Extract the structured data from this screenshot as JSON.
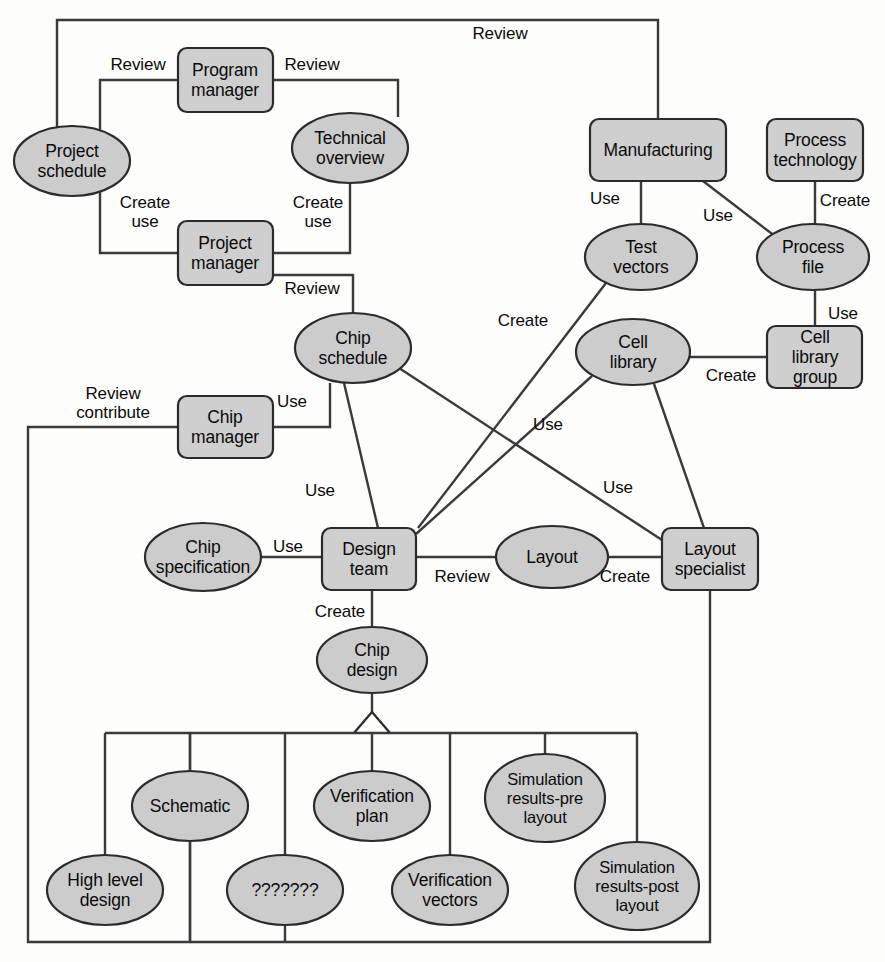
{
  "diagram": {
    "type": "entity-relationship-diagram",
    "background_color": "#fdfdfb",
    "node_fill_color": "#cccccc",
    "node_stroke_color": "#2b2b2b",
    "edge_color": "#3a3a3a",
    "nodes": [
      {
        "id": "project-schedule",
        "label": "Project\nschedule",
        "shape": "ellipse",
        "cx": 72,
        "cy": 161,
        "rx": 58,
        "ry": 35
      },
      {
        "id": "program-manager",
        "label": "Program\nmanager",
        "shape": "box",
        "cx": 225,
        "cy": 80,
        "w": 95,
        "h": 64
      },
      {
        "id": "technical-overview",
        "label": "Technical\noverview",
        "shape": "ellipse",
        "cx": 350,
        "cy": 148,
        "rx": 58,
        "ry": 35
      },
      {
        "id": "project-manager",
        "label": "Project\nmanager",
        "shape": "box",
        "cx": 225,
        "cy": 253,
        "w": 95,
        "h": 64
      },
      {
        "id": "chip-schedule",
        "label": "Chip\nschedule",
        "shape": "ellipse",
        "cx": 353,
        "cy": 348,
        "rx": 58,
        "ry": 35
      },
      {
        "id": "chip-manager",
        "label": "Chip\nmanager",
        "shape": "box",
        "cx": 225,
        "cy": 427,
        "w": 95,
        "h": 62
      },
      {
        "id": "chip-specification",
        "label": "Chip\nspecification",
        "shape": "ellipse",
        "cx": 203,
        "cy": 557,
        "rx": 58,
        "ry": 34
      },
      {
        "id": "design-team",
        "label": "Design\nteam",
        "shape": "box",
        "cx": 369,
        "cy": 559,
        "w": 94,
        "h": 62
      },
      {
        "id": "layout",
        "label": "Layout",
        "shape": "ellipse",
        "cx": 552,
        "cy": 557,
        "rx": 56,
        "ry": 31
      },
      {
        "id": "layout-specialist",
        "label": "Layout\nspecialist",
        "shape": "box",
        "cx": 710,
        "cy": 559,
        "w": 96,
        "h": 62
      },
      {
        "id": "manufacturing",
        "label": "Manufacturing",
        "shape": "box",
        "cx": 658,
        "cy": 150,
        "w": 136,
        "h": 62
      },
      {
        "id": "process-technology",
        "label": "Process\ntechnology",
        "shape": "box",
        "cx": 815,
        "cy": 150,
        "w": 96,
        "h": 62
      },
      {
        "id": "test-vectors",
        "label": "Test\nvectors",
        "shape": "ellipse",
        "cx": 641,
        "cy": 257,
        "rx": 56,
        "ry": 33
      },
      {
        "id": "process-file",
        "label": "Process\nfile",
        "shape": "ellipse",
        "cx": 813,
        "cy": 257,
        "rx": 56,
        "ry": 33
      },
      {
        "id": "cell-library",
        "label": "Cell\nlibrary",
        "shape": "ellipse",
        "cx": 633,
        "cy": 352,
        "rx": 57,
        "ry": 33
      },
      {
        "id": "cell-library-group",
        "label": "Cell library\ngroup",
        "shape": "box",
        "cx": 815,
        "cy": 357,
        "w": 95,
        "h": 62
      },
      {
        "id": "chip-design",
        "label": "Chip\ndesign",
        "shape": "ellipse",
        "cx": 372,
        "cy": 660,
        "rx": 55,
        "ry": 33
      },
      {
        "id": "schematic",
        "label": "Schematic",
        "shape": "ellipse",
        "cx": 190,
        "cy": 806,
        "rx": 58,
        "ry": 35
      },
      {
        "id": "high-level-design",
        "label": "High level\ndesign",
        "shape": "ellipse",
        "cx": 105,
        "cy": 890,
        "rx": 58,
        "ry": 35
      },
      {
        "id": "unknown-artifact",
        "label": "???????",
        "shape": "ellipse",
        "cx": 285,
        "cy": 890,
        "rx": 58,
        "ry": 35
      },
      {
        "id": "verification-plan",
        "label": "Verification\nplan",
        "shape": "ellipse",
        "cx": 372,
        "cy": 806,
        "rx": 58,
        "ry": 35
      },
      {
        "id": "verification-vectors",
        "label": "Verification\nvectors",
        "shape": "ellipse",
        "cx": 450,
        "cy": 890,
        "rx": 58,
        "ry": 35
      },
      {
        "id": "simulation-results-pre",
        "label": "Simulation\nresults-pre\nlayout",
        "shape": "ellipse",
        "cx": 545,
        "cy": 798,
        "rx": 60,
        "ry": 44
      },
      {
        "id": "simulation-results-post",
        "label": "Simulation\nresults-post\nlayout",
        "shape": "ellipse",
        "cx": 637,
        "cy": 886,
        "rx": 62,
        "ry": 44
      }
    ],
    "edge_labels": [
      {
        "id": "review-top",
        "text": "Review",
        "x": 500,
        "y": 33
      },
      {
        "id": "review-ps-pm",
        "text": "Review",
        "x": 138,
        "y": 64
      },
      {
        "id": "review-pm-to",
        "text": "Review",
        "x": 312,
        "y": 64
      },
      {
        "id": "create-use-left",
        "text": "Create\nuse",
        "x": 145,
        "y": 212
      },
      {
        "id": "create-use-right",
        "text": "Create\nuse",
        "x": 318,
        "y": 212
      },
      {
        "id": "review-pm-cs",
        "text": "Review",
        "x": 312,
        "y": 288
      },
      {
        "id": "review-contribute",
        "text": "Review\ncontribute",
        "x": 113,
        "y": 403
      },
      {
        "id": "use-cm-cs",
        "text": "Use",
        "x": 292,
        "y": 401
      },
      {
        "id": "use-cs-dt",
        "text": "Use",
        "x": 320,
        "y": 490
      },
      {
        "id": "use-cspec-dt",
        "text": "Use",
        "x": 288,
        "y": 546
      },
      {
        "id": "review-dt-layout",
        "text": "Review",
        "x": 462,
        "y": 576
      },
      {
        "id": "create-layout-ls",
        "text": "Create",
        "x": 625,
        "y": 576
      },
      {
        "id": "create-dt-cd",
        "text": "Create",
        "x": 340,
        "y": 611
      },
      {
        "id": "use-mfg-tv",
        "text": "Use",
        "x": 605,
        "y": 198
      },
      {
        "id": "use-mfg-pf",
        "text": "Use",
        "x": 718,
        "y": 215
      },
      {
        "id": "create-pt-pf",
        "text": "Create",
        "x": 845,
        "y": 200
      },
      {
        "id": "use-pf-clg",
        "text": "Use",
        "x": 843,
        "y": 313
      },
      {
        "id": "create-clg-cl",
        "text": "Create",
        "x": 731,
        "y": 375
      },
      {
        "id": "create-tv-dt",
        "text": "Create",
        "x": 523,
        "y": 320
      },
      {
        "id": "use-cl-dt",
        "text": "Use",
        "x": 548,
        "y": 424
      },
      {
        "id": "use-cl-ls",
        "text": "Use",
        "x": 618,
        "y": 487
      }
    ],
    "relationships": [
      {
        "from": "project-schedule",
        "to": "manufacturing",
        "label": "Review"
      },
      {
        "from": "project-schedule",
        "to": "program-manager",
        "label": "Review"
      },
      {
        "from": "program-manager",
        "to": "technical-overview",
        "label": "Review"
      },
      {
        "from": "project-schedule",
        "to": "project-manager",
        "label": "Create use"
      },
      {
        "from": "technical-overview",
        "to": "project-manager",
        "label": "Create use"
      },
      {
        "from": "project-manager",
        "to": "chip-schedule",
        "label": "Review"
      },
      {
        "from": "chip-manager",
        "to": "chip-schedule",
        "label": "Use"
      },
      {
        "from": "chip-manager",
        "to": "chip-design",
        "label": "Review contribute"
      },
      {
        "from": "chip-schedule",
        "to": "design-team",
        "label": "Use"
      },
      {
        "from": "chip-schedule",
        "to": "layout-specialist",
        "label": "Use"
      },
      {
        "from": "chip-specification",
        "to": "design-team",
        "label": "Use"
      },
      {
        "from": "design-team",
        "to": "layout",
        "label": "Review"
      },
      {
        "from": "layout",
        "to": "layout-specialist",
        "label": "Create"
      },
      {
        "from": "design-team",
        "to": "chip-design",
        "label": "Create"
      },
      {
        "from": "manufacturing",
        "to": "test-vectors",
        "label": "Use"
      },
      {
        "from": "manufacturing",
        "to": "process-file",
        "label": "Use"
      },
      {
        "from": "process-technology",
        "to": "process-file",
        "label": "Create"
      },
      {
        "from": "process-file",
        "to": "cell-library-group",
        "label": "Use"
      },
      {
        "from": "cell-library-group",
        "to": "cell-library",
        "label": "Create"
      },
      {
        "from": "test-vectors",
        "to": "design-team",
        "label": "Create"
      },
      {
        "from": "cell-library",
        "to": "design-team",
        "label": "Use"
      },
      {
        "from": "cell-library",
        "to": "layout-specialist",
        "label": "Use"
      },
      {
        "from": "layout-specialist",
        "to": "chip-design",
        "label": ""
      },
      {
        "from": "chip-design",
        "to": "schematic",
        "label": "aggregation"
      },
      {
        "from": "chip-design",
        "to": "high-level-design",
        "label": "aggregation"
      },
      {
        "from": "chip-design",
        "to": "unknown-artifact",
        "label": "aggregation"
      },
      {
        "from": "chip-design",
        "to": "verification-plan",
        "label": "aggregation"
      },
      {
        "from": "chip-design",
        "to": "verification-vectors",
        "label": "aggregation"
      },
      {
        "from": "chip-design",
        "to": "simulation-results-pre",
        "label": "aggregation"
      },
      {
        "from": "chip-design",
        "to": "simulation-results-post",
        "label": "aggregation"
      }
    ]
  }
}
